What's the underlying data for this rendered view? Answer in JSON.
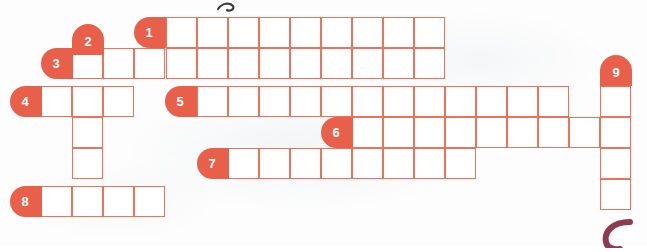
{
  "puzzle": {
    "type": "crossword-grid",
    "title_fragment": "",
    "cell_size": 31,
    "origin": {
      "x": 10,
      "y": 17
    },
    "colors": {
      "cell_border": "#ef7158",
      "clue_tag_background": "#e8604a",
      "clue_tag_text": "#ffffff",
      "cell_fill": "#ffffff",
      "page_background": "#fdfdfd",
      "page_number_deco": "#8e3b52"
    },
    "entries": [
      {
        "number": "1",
        "direction": "across",
        "tag_side": "left",
        "row": 0,
        "col": 5,
        "length": 9,
        "tag_x": 134,
        "tag_y": 17,
        "cells_x": 166,
        "cells_y": 17
      },
      {
        "number": "2",
        "direction": "down",
        "tag_side": "top",
        "row": 1,
        "col": 2,
        "length": 6,
        "tag_x": 72,
        "tag_y": 24,
        "cells_x": 72,
        "cells_y": 48
      },
      {
        "number": "3",
        "direction": "across",
        "tag_side": "left",
        "row": 1,
        "col": 2,
        "length": 12,
        "tag_x": 41,
        "tag_y": 48,
        "cells_x": 72,
        "cells_y": 48
      },
      {
        "number": "4",
        "direction": "across",
        "tag_side": "left",
        "row": 2,
        "col": 1,
        "length": 3,
        "tag_x": 10,
        "tag_y": 86,
        "cells_x": 41,
        "cells_y": 86
      },
      {
        "number": "5",
        "direction": "across",
        "tag_side": "left",
        "row": 2,
        "col": 6,
        "length": 12,
        "tag_x": 165,
        "tag_y": 86,
        "cells_x": 197,
        "cells_y": 86
      },
      {
        "number": "6",
        "direction": "across",
        "tag_side": "left",
        "row": 3,
        "col": 11,
        "length": 9,
        "tag_x": 321,
        "tag_y": 117,
        "cells_x": 352,
        "cells_y": 117
      },
      {
        "number": "7",
        "direction": "across",
        "tag_side": "left",
        "row": 4,
        "col": 7,
        "length": 8,
        "tag_x": 197,
        "tag_y": 148,
        "cells_x": 228,
        "cells_y": 148
      },
      {
        "number": "8",
        "direction": "across",
        "tag_side": "left",
        "row": 5,
        "col": 1,
        "length": 4,
        "tag_x": 10,
        "tag_y": 186,
        "cells_x": 41,
        "cells_y": 186
      },
      {
        "number": "9",
        "direction": "down",
        "tag_side": "top",
        "row": 2,
        "col": 19,
        "length": 4,
        "tag_x": 600,
        "tag_y": 55,
        "cells_x": 600,
        "cells_y": 86
      }
    ],
    "cells": [
      {
        "x": 166,
        "y": 17
      },
      {
        "x": 197,
        "y": 17
      },
      {
        "x": 228,
        "y": 17
      },
      {
        "x": 259,
        "y": 17
      },
      {
        "x": 290,
        "y": 17
      },
      {
        "x": 321,
        "y": 17
      },
      {
        "x": 352,
        "y": 17
      },
      {
        "x": 383,
        "y": 17
      },
      {
        "x": 414,
        "y": 17
      },
      {
        "x": 72,
        "y": 48
      },
      {
        "x": 103,
        "y": 48
      },
      {
        "x": 134,
        "y": 48
      },
      {
        "x": 166,
        "y": 48
      },
      {
        "x": 197,
        "y": 48
      },
      {
        "x": 228,
        "y": 48
      },
      {
        "x": 259,
        "y": 48
      },
      {
        "x": 290,
        "y": 48
      },
      {
        "x": 321,
        "y": 48
      },
      {
        "x": 352,
        "y": 48
      },
      {
        "x": 383,
        "y": 48
      },
      {
        "x": 414,
        "y": 48
      },
      {
        "x": 41,
        "y": 86
      },
      {
        "x": 72,
        "y": 86
      },
      {
        "x": 103,
        "y": 86
      },
      {
        "x": 197,
        "y": 86
      },
      {
        "x": 228,
        "y": 86
      },
      {
        "x": 259,
        "y": 86
      },
      {
        "x": 290,
        "y": 86
      },
      {
        "x": 321,
        "y": 86
      },
      {
        "x": 352,
        "y": 86
      },
      {
        "x": 383,
        "y": 86
      },
      {
        "x": 414,
        "y": 86
      },
      {
        "x": 445,
        "y": 86
      },
      {
        "x": 476,
        "y": 86
      },
      {
        "x": 507,
        "y": 86
      },
      {
        "x": 538,
        "y": 86
      },
      {
        "x": 600,
        "y": 86
      },
      {
        "x": 72,
        "y": 117
      },
      {
        "x": 352,
        "y": 117
      },
      {
        "x": 383,
        "y": 117
      },
      {
        "x": 414,
        "y": 117
      },
      {
        "x": 445,
        "y": 117
      },
      {
        "x": 476,
        "y": 117
      },
      {
        "x": 507,
        "y": 117
      },
      {
        "x": 538,
        "y": 117
      },
      {
        "x": 569,
        "y": 117
      },
      {
        "x": 600,
        "y": 117
      },
      {
        "x": 72,
        "y": 148
      },
      {
        "x": 228,
        "y": 148
      },
      {
        "x": 259,
        "y": 148
      },
      {
        "x": 290,
        "y": 148
      },
      {
        "x": 321,
        "y": 148
      },
      {
        "x": 352,
        "y": 148
      },
      {
        "x": 383,
        "y": 148
      },
      {
        "x": 414,
        "y": 148
      },
      {
        "x": 445,
        "y": 148
      },
      {
        "x": 600,
        "y": 148
      },
      {
        "x": 41,
        "y": 186
      },
      {
        "x": 72,
        "y": 186
      },
      {
        "x": 103,
        "y": 186
      },
      {
        "x": 134,
        "y": 186
      },
      {
        "x": 600,
        "y": 179
      }
    ]
  },
  "page_footer": {
    "page_number": "103"
  }
}
